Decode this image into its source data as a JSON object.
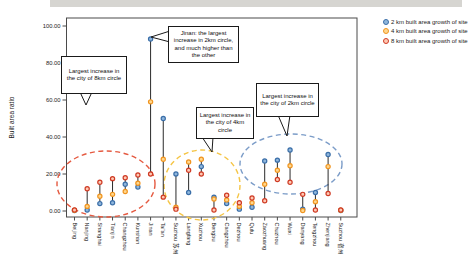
{
  "chart_data": {
    "type": "scatter",
    "title": "",
    "xlabel": "",
    "ylabel": "Built area ratio",
    "ylim": [
      0,
      100
    ],
    "yticks": [
      "0.00",
      "20.00",
      "40.00",
      "60.00",
      "80.00",
      "100.00"
    ],
    "grid": false,
    "legend_position": "top-right",
    "categories": [
      "Beijing",
      "Nanjing",
      "Shanghai",
      "Tianjin",
      "Changzhou",
      "Kunshan",
      "Jinan",
      "Tai'an",
      "Suzhou 苏州",
      "Langfang",
      "Xuzhou",
      "Bengbu",
      "Cangzhou",
      "Dezhou",
      "Qufu",
      "Zaozhuang",
      "Chuzhou",
      "Wuxi",
      "Danyang",
      "Tengzhou",
      "Zhenjiang",
      "Suzhou 宿州"
    ],
    "series": [
      {
        "name": "2 km built area growth of site",
        "color": "#3a6ea8",
        "fill": "#8fb6dc",
        "values": [
          0.3,
          0.5,
          4,
          4.5,
          14.5,
          13,
          93,
          50,
          20,
          10,
          24,
          7.5,
          4,
          1,
          2,
          27,
          27.5,
          33,
          1,
          10,
          30.5,
          0.3
        ]
      },
      {
        "name": "4 km built area growth of site",
        "color": "#f0941f",
        "fill": "#ffd78e",
        "values": [
          0.4,
          2.5,
          8,
          9,
          10.5,
          15,
          59,
          28,
          2,
          26.5,
          28,
          6.5,
          6,
          2.5,
          4.5,
          14.5,
          22,
          24.5,
          0.3,
          5,
          24,
          0.4
        ]
      },
      {
        "name": "8 km built area growth of site",
        "color": "#cf3a24",
        "fill": "#ffc9b4",
        "values": [
          0.6,
          12,
          15.5,
          17.5,
          18,
          19.5,
          20,
          7.5,
          1,
          22,
          20,
          0.5,
          8.5,
          4.5,
          7,
          5.5,
          17,
          15.5,
          9,
          0.5,
          9.5,
          0.5
        ]
      }
    ],
    "annotations": [
      {
        "text": "Largest increase in the city of 8km circle",
        "box": {
          "left": 61,
          "top": 56,
          "width": 66,
          "height": 38
        },
        "pointer": {
          "tip": [
            86,
            105
          ],
          "base": [
            [
              80,
              92
            ],
            [
              92,
              92
            ]
          ]
        }
      },
      {
        "text": "Jinan: the largest increase in 2km circle, and much higher than the other",
        "box": {
          "left": 168,
          "top": 26,
          "width": 71,
          "height": 37
        },
        "pointer": {
          "tip": [
            151,
            37
          ],
          "base": [
            [
              170,
              31
            ],
            [
              170,
              42
            ]
          ]
        }
      },
      {
        "text": "Largest increase in the city of 4km circle",
        "box": {
          "left": 196,
          "top": 107,
          "width": 58,
          "height": 32
        },
        "pointer": {
          "tip": [
            212,
            152
          ],
          "base": [
            [
              202,
              137
            ],
            [
              213,
              137
            ]
          ]
        }
      },
      {
        "text": "Largest increase in the city of 2km circle",
        "box": {
          "left": 256,
          "top": 83,
          "width": 63,
          "height": 34
        },
        "pointer": {
          "tip": [
            287,
            136
          ],
          "base": [
            [
              278,
              115
            ],
            [
              290,
              115
            ]
          ]
        }
      }
    ],
    "highlight_ellipses": [
      {
        "label": "8km-largest-increase-cluster",
        "color": "#e55a41",
        "cx": 106,
        "cy": 184,
        "rx": 49,
        "ry": 33
      },
      {
        "label": "4km-largest-increase-cluster",
        "color": "#f5c546",
        "cx": 202,
        "cy": 185,
        "rx": 38,
        "ry": 35
      },
      {
        "label": "2km-largest-increase-cluster",
        "color": "#7b9cc8",
        "cx": 291,
        "cy": 164,
        "rx": 51,
        "ry": 30
      }
    ]
  }
}
